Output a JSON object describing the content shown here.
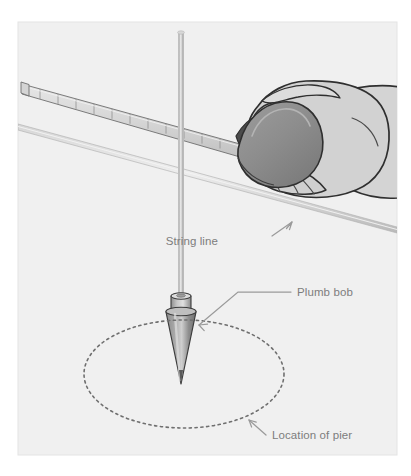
{
  "figure": {
    "panel": {
      "background_color": "#f0f0f0",
      "border_color": "#e2e2e2",
      "x": 18,
      "y": 22,
      "width": 379,
      "height": 433
    },
    "labels": [
      {
        "id": "string-line",
        "text": "String line",
        "x": 218,
        "y": 241
      },
      {
        "id": "plumb-bob",
        "text": "Plumb bob",
        "x": 297,
        "y": 296
      },
      {
        "id": "location-of-pier",
        "text": "Location of pier",
        "x": 272,
        "y": 439
      }
    ],
    "parts": [
      {
        "id": "tape-measure",
        "name": "tape measure blade",
        "color": "#dcdcdc"
      },
      {
        "id": "tape-case",
        "name": "tape measure case",
        "color": "#8e8e8e"
      },
      {
        "id": "hand",
        "name": "hand gripping tape measure",
        "color": "#d2d2d2"
      },
      {
        "id": "string-line",
        "name": "string line",
        "color": "#c9c9c9"
      },
      {
        "id": "plumb-string",
        "name": "plumb bob string",
        "color": "#c4c4c4"
      },
      {
        "id": "plumb-bob",
        "name": "plumb bob",
        "color": "#8f8f8f"
      },
      {
        "id": "pier-outline",
        "name": "dashed pier location ellipse",
        "color": "#6f6f6f"
      }
    ],
    "colors": {
      "label_text": "#7d7d7d",
      "leader_line": "#9a9a9a",
      "outline": "#3a3a3a",
      "panel_bg": "#f0f0f0"
    }
  }
}
